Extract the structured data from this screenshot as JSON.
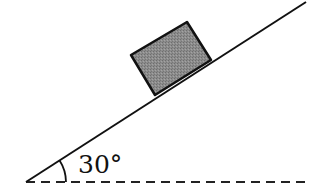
{
  "diagram": {
    "angle_label": "30°",
    "angle_degrees": 30,
    "elements": {
      "incline": {
        "x1": 26,
        "y1": 182,
        "x2": 306,
        "y2": 2,
        "color": "#111111"
      },
      "baseline": {
        "x1": 26,
        "y1": 182,
        "x2": 306,
        "y2": 182,
        "style": "dashed",
        "color": "#111111"
      },
      "block": {
        "points": "131,55 187,22 211,60 155,95",
        "fill": "#8a8a8a",
        "stroke": "#111111"
      },
      "angle_arc": {
        "cx": 26,
        "cy": 182,
        "r": 40
      }
    }
  }
}
